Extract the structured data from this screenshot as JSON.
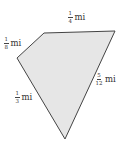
{
  "figure": {
    "shape": "quadrilateral",
    "fill_color": "#e6e6e6",
    "stroke_color": "#444444",
    "vertices": [
      [
        17,
        58
      ],
      [
        44,
        33
      ],
      [
        115,
        31
      ],
      [
        65,
        139
      ]
    ],
    "sides": [
      {
        "id": "top_left",
        "numerator": "1",
        "denominator": "8",
        "unit": "mi"
      },
      {
        "id": "top",
        "numerator": "1",
        "denominator": "4",
        "unit": "mi"
      },
      {
        "id": "right",
        "numerator": "5",
        "denominator": "12",
        "unit": "mi"
      },
      {
        "id": "left",
        "numerator": "1",
        "denominator": "3",
        "unit": "mi"
      }
    ]
  }
}
